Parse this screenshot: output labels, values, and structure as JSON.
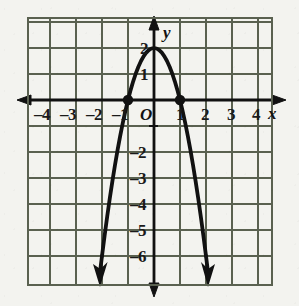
{
  "figure": {
    "background_color": "#f3f3ef",
    "grid_line_color": "#5a6150",
    "axis_color": "#111111",
    "curve_color": "#111111"
  },
  "chart_data": {
    "type": "line",
    "title": "",
    "xlabel": "x",
    "ylabel": "y",
    "xlim": [
      -4.85,
      4.55
    ],
    "ylim": [
      -7.1,
      3.15
    ],
    "grid": true,
    "grid_step": 1,
    "legend": "none",
    "equation": "y = -2x^2 + 2",
    "vertex": {
      "x": 0,
      "y": 2
    },
    "x_intercepts": [
      -1,
      1
    ],
    "y_intercept": 2,
    "marked_points": [
      {
        "x": -1,
        "y": 0,
        "style": "filled-dot"
      },
      {
        "x": 1,
        "y": 0,
        "style": "filled-dot"
      }
    ],
    "arrowheads": [
      {
        "x": -1.96,
        "y": -5.68,
        "direction": "down"
      },
      {
        "x": 1.96,
        "y": -5.68,
        "direction": "down"
      }
    ],
    "x_tick_values": [
      -4,
      -3,
      -2,
      -1,
      1,
      2,
      3,
      4
    ],
    "y_tick_values": [
      2,
      1,
      -2,
      -3,
      -4,
      -5,
      -6
    ],
    "x": [
      -2.0,
      -1.9,
      -1.8,
      -1.7,
      -1.6,
      -1.5,
      -1.4,
      -1.3,
      -1.2,
      -1.1,
      -1.0,
      -0.9,
      -0.8,
      -0.7,
      -0.6,
      -0.5,
      -0.4,
      -0.3,
      -0.2,
      -0.1,
      0.0,
      0.1,
      0.2,
      0.3,
      0.4,
      0.5,
      0.6,
      0.7,
      0.8,
      0.9,
      1.0,
      1.1,
      1.2,
      1.3,
      1.4,
      1.5,
      1.6,
      1.7,
      1.8,
      1.9,
      2.0
    ],
    "y": [
      -6.0,
      -5.22,
      -4.48,
      -3.78,
      -3.12,
      -2.5,
      -1.92,
      -1.38,
      -0.88,
      -0.42,
      0.0,
      0.38,
      0.72,
      1.02,
      1.28,
      1.5,
      1.68,
      1.82,
      1.92,
      1.98,
      2.0,
      1.98,
      1.92,
      1.82,
      1.68,
      1.5,
      1.28,
      1.02,
      0.72,
      0.38,
      0.0,
      -0.42,
      -0.88,
      -1.38,
      -1.92,
      -2.5,
      -3.12,
      -3.78,
      -4.48,
      -5.22,
      -6.0
    ]
  },
  "axes": {
    "x_axis_label": "x",
    "y_axis_label": "y",
    "origin_label": "O",
    "x_ticks": [
      {
        "value": -4,
        "text": "–4"
      },
      {
        "value": -3,
        "text": "–3"
      },
      {
        "value": -2,
        "text": "–2"
      },
      {
        "value": -1,
        "text": "–1"
      },
      {
        "value": 1,
        "text": "1"
      },
      {
        "value": 2,
        "text": "2"
      },
      {
        "value": 3,
        "text": "3"
      },
      {
        "value": 4,
        "text": "4"
      }
    ],
    "y_ticks": [
      {
        "value": 2,
        "text": "2"
      },
      {
        "value": 1,
        "text": "1"
      },
      {
        "value": -2,
        "text": "–2"
      },
      {
        "value": -3,
        "text": "–3"
      },
      {
        "value": -4,
        "text": "–4"
      },
      {
        "value": -5,
        "text": "–5"
      },
      {
        "value": -6,
        "text": "–6"
      }
    ]
  }
}
